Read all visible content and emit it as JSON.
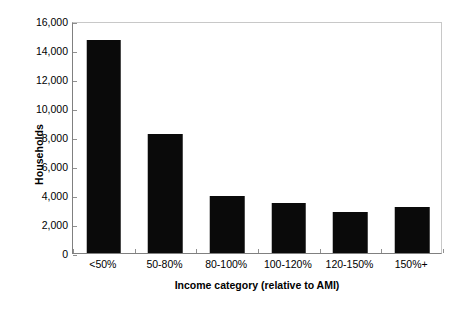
{
  "chart_data": {
    "type": "bar",
    "title": "",
    "categories": [
      "<50%",
      "50-80%",
      "80-100%",
      "100-120%",
      "120-150%",
      "150%+"
    ],
    "values": [
      14700,
      8200,
      3950,
      3450,
      2850,
      3150
    ],
    "series": [
      {
        "name": "Households",
        "values": [
          14700,
          8200,
          3950,
          3450,
          2850,
          3150
        ]
      }
    ],
    "xlabel": "Income category (relative to AMI)",
    "ylabel": "Households",
    "ylim": [
      0,
      16000
    ],
    "ytick_step": 2000,
    "ytick_labels": [
      "0",
      "2,000",
      "4,000",
      "6,000",
      "8,000",
      "10,000",
      "12,000",
      "14,000",
      "16,000"
    ],
    "ytick_values": [
      0,
      2000,
      4000,
      6000,
      8000,
      10000,
      12000,
      14000,
      16000
    ],
    "grid": false,
    "legend": false,
    "legend_position": "none",
    "bar_color": "#0a0a0a",
    "axis_color": "#808080",
    "plot_border_color": "#c8c8c8",
    "background_color": "#ffffff"
  }
}
